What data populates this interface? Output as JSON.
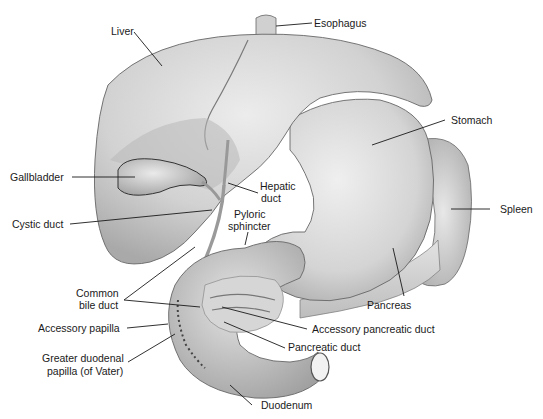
{
  "figure": {
    "tones": {
      "organ_light": "#e6e6e6",
      "organ_mid": "#c9c9c9",
      "organ_dark": "#9a9a9a",
      "outline": "#555555",
      "text": "#1a1a1a",
      "background": "#ffffff"
    }
  },
  "labels": {
    "liver": "Liver",
    "esophagus": "Esophagus",
    "stomach": "Stomach",
    "gallbladder": "Gallbladder",
    "hepatic_duct_1": "Hepatic",
    "hepatic_duct_2": "duct",
    "cystic_duct": "Cystic duct",
    "pyloric_sphincter_1": "Pyloric",
    "pyloric_sphincter_2": "sphincter",
    "spleen": "Spleen",
    "common_bile_duct_1": "Common",
    "common_bile_duct_2": "bile duct",
    "pancreas": "Pancreas",
    "accessory_papilla": "Accessory papilla",
    "accessory_pancreatic_duct": "Accessory pancreatic duct",
    "greater_duodenal_papilla_1": "Greater duodenal",
    "greater_duodenal_papilla_2": "papilla (of Vater)",
    "pancreatic_duct": "Pancreatic duct",
    "duodenum": "Duodenum"
  }
}
